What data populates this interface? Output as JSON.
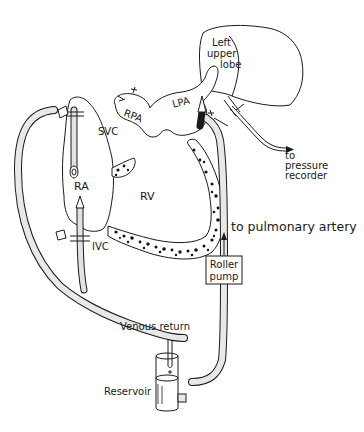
{
  "diagram": {
    "type": "perfusion circuit schematic",
    "labels": {
      "left_upper_lobe_line1": "Left",
      "left_upper_lobe_line2": "upper",
      "left_upper_lobe_line3": "lobe",
      "rpa": "RPA",
      "lpa": "LPA",
      "svc": "SVC",
      "ra": "RA",
      "rv": "RV",
      "ivc": "IVC",
      "pressure_line1": "to",
      "pressure_line2": "pressure",
      "pressure_line3": "recorder",
      "to_pulmonary_artery": "to pulmonary artery",
      "roller_pump_line1": "Roller",
      "roller_pump_line2": "pump",
      "venous_return": "Venous return",
      "reservoir": "Reservoir"
    },
    "flow": [
      {
        "from": "SVC / IVC cannulae",
        "to": "Reservoir",
        "label": "Venous return"
      },
      {
        "from": "Reservoir",
        "to": "Roller pump"
      },
      {
        "from": "Roller pump",
        "to": "LPA",
        "label": "to pulmonary artery"
      },
      {
        "from": "Left upper lobe vein",
        "to": "pressure recorder"
      }
    ],
    "colors": {
      "ink": "#1a1a1a",
      "tube_fill": "#e8e8e8",
      "background": "#ffffff"
    }
  }
}
